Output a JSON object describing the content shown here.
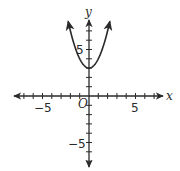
{
  "chart_data": {
    "type": "line",
    "title": "",
    "xlabel": "x",
    "ylabel": "y",
    "origin_label": "O",
    "xlim": [
      -8,
      8
    ],
    "ylim": [
      -8,
      8
    ],
    "tick_step": 1,
    "x_tick_labels": [
      {
        "value": -5,
        "label": "−5"
      },
      {
        "value": 5,
        "label": "5"
      }
    ],
    "y_tick_labels": [
      {
        "value": 5,
        "label": "5"
      },
      {
        "value": -5,
        "label": "−5"
      }
    ],
    "grid": false,
    "legend": null,
    "series": [
      {
        "name": "y = x^2 + 3",
        "equation": "y = x^2 + 3",
        "vertex": [
          0,
          3
        ],
        "x": [
          -2.24,
          -2,
          -1.5,
          -1,
          -0.5,
          0,
          0.5,
          1,
          1.5,
          2,
          2.24
        ],
        "y": [
          8.0,
          7,
          5.25,
          4,
          3.25,
          3,
          3.25,
          4,
          5.25,
          7,
          8.0
        ],
        "arrows_on_ends": true
      }
    ]
  },
  "axes": {
    "x_label": "x",
    "y_label": "y",
    "origin_label": "O",
    "x_tick_neg5": "−5",
    "x_tick_pos5": "5",
    "y_tick_pos5": "5",
    "y_tick_neg5": "−5"
  },
  "colors": {
    "axis": "#2a2a2a",
    "curve": "#2a2a2a",
    "background": "#ffffff"
  }
}
